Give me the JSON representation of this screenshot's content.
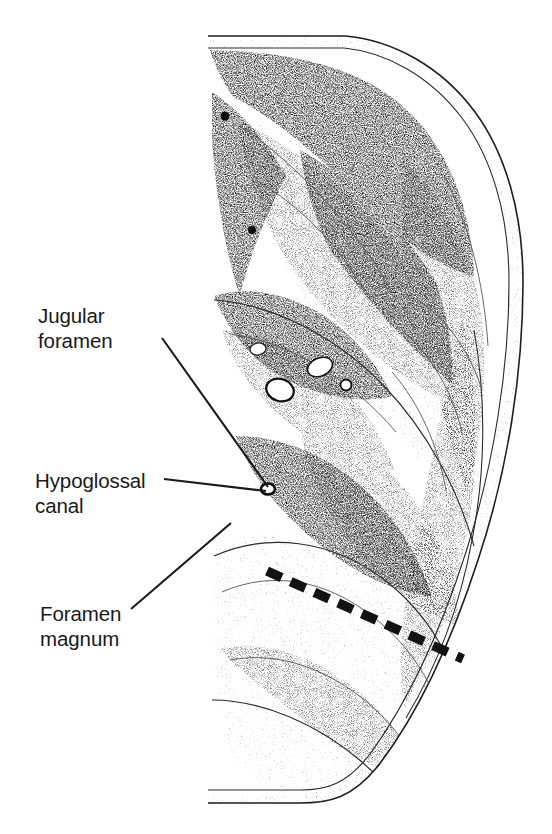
{
  "figure": {
    "type": "anatomical-illustration",
    "style": "stippled halftone line drawing, black on white",
    "background_color": "#ffffff",
    "ink_color": "#1a1a1a"
  },
  "labels": [
    {
      "id": "jugular-foramen",
      "lines": [
        "Jugular",
        "foramen"
      ],
      "line1": "Jugular",
      "line2": "foramen",
      "text_x": 38,
      "text_y": 303,
      "leader": {
        "x1": 162,
        "y1": 338,
        "x2": 268,
        "y2": 487
      }
    },
    {
      "id": "hypoglossal-canal",
      "lines": [
        "Hypoglossal",
        "canal"
      ],
      "line1": "Hypoglossal",
      "line2": "canal",
      "text_x": 35,
      "text_y": 468,
      "leader": {
        "x1": 164,
        "y1": 479,
        "x2": 266,
        "y2": 491
      }
    },
    {
      "id": "foramen-magnum",
      "lines": [
        "Foramen",
        "magnum"
      ],
      "line1": "Foramen",
      "line2": "magnum",
      "text_x": 40,
      "text_y": 601,
      "leader": {
        "x1": 131,
        "y1": 609,
        "x2": 231,
        "y2": 523
      }
    }
  ],
  "annotations": {
    "dashed_plane": {
      "name": "dashed-reference-line",
      "description": "Heavy dashed line crossing the posterior cranial fossa",
      "color": "#121212",
      "x1": 267,
      "y1": 571,
      "x2": 463,
      "y2": 659,
      "dash_count": 12
    }
  },
  "illustration_bounds": {
    "left": 208,
    "top": 34,
    "right": 524,
    "bottom": 803
  },
  "colors": {
    "ink": "#1a1a1a",
    "text": "#191919",
    "paper": "#ffffff"
  }
}
